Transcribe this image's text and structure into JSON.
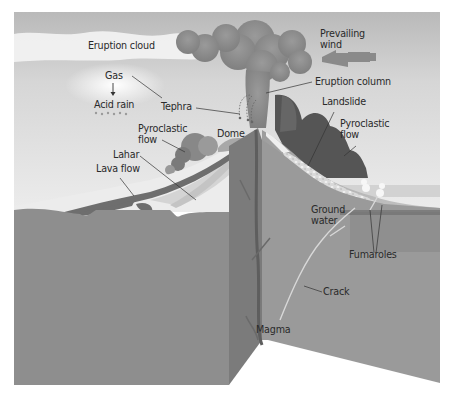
{
  "labels": {
    "eruption_cloud": "Eruption cloud",
    "prevailing_wind": "Prevailing\nwind",
    "gas": "Gas",
    "acid_rain": "Acid rain",
    "tephra": "Tephra",
    "eruption_column": "Eruption column",
    "landslide": "Landslide",
    "pyroclastic_flow_left": "Pyroclastic\nflow",
    "pyroclastic_flow_right": "Pyroclastic\nflow",
    "dome": "Dome",
    "lahar": "Lahar",
    "lava_flow": "Lava flow",
    "ground_water": "Ground\nwater",
    "fumaroles": "Fumaroles",
    "crack": "Crack",
    "magma": "Magma"
  },
  "icons": {
    "wind_arrow": "left-arrow",
    "gas_arrow": "down-arrow"
  },
  "colors": {
    "sky_top": "#bdbdbd",
    "sky_bottom": "#e6e6e6",
    "cloud": "#8f8f8f",
    "ground_front": "#8e8e8e",
    "ground_side": "#7a7a7a",
    "slope_light": "#e8e8e8",
    "lava": "#6e6e6e",
    "wind_arrow": "#888888",
    "label_text": "#2a2a2a"
  }
}
